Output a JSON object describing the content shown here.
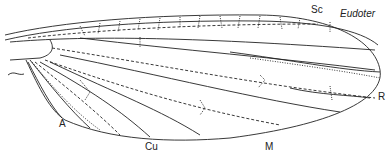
{
  "figure": {
    "title": "Eudoter",
    "labels": [
      {
        "id": "sc",
        "text": "Sc",
        "x": 311,
        "y": 4
      },
      {
        "id": "r",
        "text": "R",
        "x": 378,
        "y": 91
      },
      {
        "id": "a",
        "text": "A",
        "x": 59,
        "y": 118
      },
      {
        "id": "cu",
        "text": "Cu",
        "x": 145,
        "y": 141
      },
      {
        "id": "m",
        "text": "M",
        "x": 265,
        "y": 141
      }
    ],
    "line_color": "#222222"
  }
}
